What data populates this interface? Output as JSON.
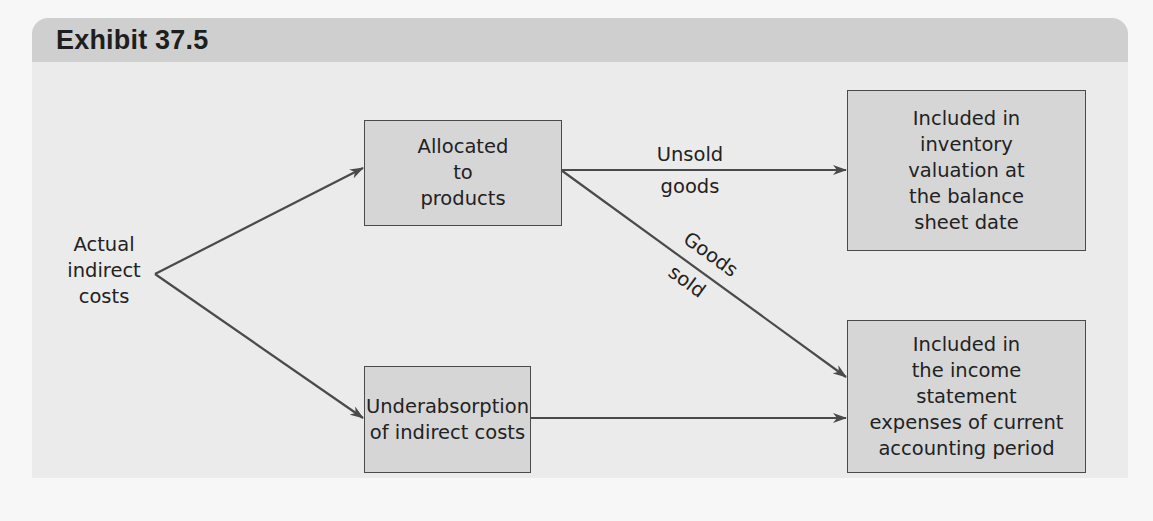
{
  "exhibit": {
    "title": "Exhibit 37.5"
  },
  "diagram": {
    "source": {
      "lines": [
        "Actual",
        "indirect",
        "costs"
      ]
    },
    "nodes": {
      "allocated": {
        "lines": [
          "Allocated",
          "to",
          "products"
        ]
      },
      "underabsorption": {
        "lines": [
          "Underabsorption",
          "of indirect costs"
        ]
      },
      "inventory": {
        "lines": [
          "Included in",
          "inventory",
          "valuation at",
          "the balance",
          "sheet date"
        ]
      },
      "income": {
        "lines": [
          "Included in",
          "the income",
          "statement",
          "expenses of current",
          "accounting period"
        ]
      }
    },
    "edge_labels": {
      "unsold_top": "Unsold",
      "unsold_bottom": "goods",
      "sold_top": "Goods",
      "sold_bottom": "sold"
    },
    "edges": [
      {
        "from": "source",
        "to": "allocated"
      },
      {
        "from": "source",
        "to": "underabsorption"
      },
      {
        "from": "allocated",
        "to": "inventory",
        "label": "Unsold goods"
      },
      {
        "from": "allocated",
        "to": "income",
        "label": "Goods sold"
      },
      {
        "from": "underabsorption",
        "to": "income"
      }
    ],
    "colors": {
      "box_fill": "#d6d6d6",
      "line": "#4a4a4a",
      "panel": "#ebebeb",
      "header": "#cfcfcf"
    }
  }
}
